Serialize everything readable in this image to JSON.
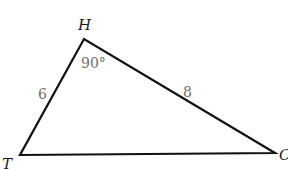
{
  "diagram": {
    "type": "right-triangle",
    "vertices": [
      {
        "name": "H",
        "x": 84,
        "y": 39,
        "label_x": 78,
        "label_y": 30
      },
      {
        "name": "T",
        "x": 20,
        "y": 155,
        "label_x": 2,
        "label_y": 169
      },
      {
        "name": "C",
        "x": 275,
        "y": 153,
        "label_x": 279,
        "label_y": 160
      }
    ],
    "side_labels": [
      {
        "text": "6",
        "side": "HT",
        "x": 38,
        "y": 99
      },
      {
        "text": "8",
        "side": "HC",
        "x": 183,
        "y": 97
      }
    ],
    "angle_label": {
      "text": "90°",
      "vertex": "H",
      "x": 81,
      "y": 68
    },
    "colors": {
      "stroke": "#111111",
      "vertex_label": "#1a1a1a",
      "measure_label": "#6e6e6e"
    }
  }
}
